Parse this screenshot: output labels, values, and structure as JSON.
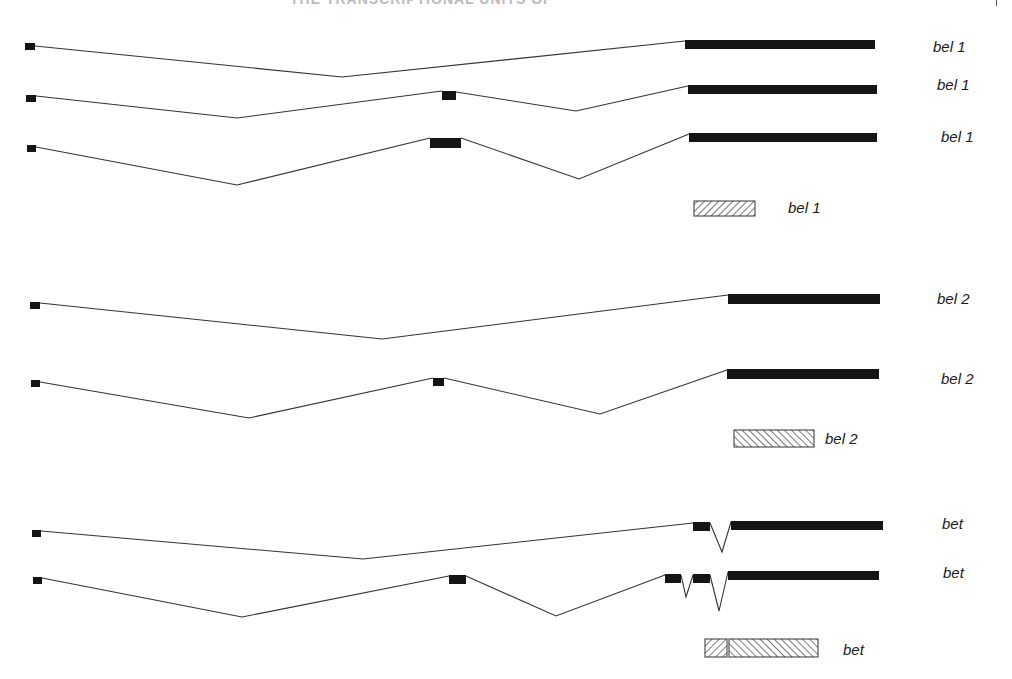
{
  "figure": {
    "header_text": "THE TRANSCRIPTIONAL UNITS OF",
    "colors": {
      "exon": "#151515",
      "intron_line": "#333333",
      "hatch": "#333333",
      "background": "#ffffff"
    },
    "groups": [
      {
        "name": "bel 1",
        "transcripts": [
          {
            "label": "bel 1",
            "label_pos": [
              933,
              38
            ],
            "exons": [
              [
                25,
                43,
                10,
                7
              ],
              [
                685,
                40,
                190,
                9
              ]
            ],
            "introns": [
              [
                [
                  35,
                  46
                ],
                [
                  342,
                  77
                ],
                [
                  685,
                  41
                ]
              ]
            ]
          },
          {
            "label": "bel 1",
            "label_pos": [
              937,
              76
            ],
            "exons": [
              [
                26,
                95,
                10,
                7
              ],
              [
                442,
                91,
                14,
                9
              ],
              [
                688,
                85,
                189,
                9
              ]
            ],
            "introns": [
              [
                [
                  36,
                  96
                ],
                [
                  237,
                  118
                ],
                [
                  442,
                  91
                ]
              ],
              [
                [
                  456,
                  92
                ],
                [
                  576,
                  111
                ],
                [
                  688,
                  86
                ]
              ]
            ]
          },
          {
            "label": "bel 1",
            "label_pos": [
              941,
              128
            ],
            "exons": [
              [
                27,
                145,
                9,
                7
              ],
              [
                430,
                138,
                31,
                10
              ],
              [
                689,
                133,
                188,
                9
              ]
            ],
            "introns": [
              [
                [
                  36,
                  147
                ],
                [
                  237,
                  185
                ],
                [
                  430,
                  138
                ]
              ],
              [
                [
                  461,
                  138
                ],
                [
                  579,
                  179
                ],
                [
                  689,
                  134
                ]
              ]
            ]
          }
        ],
        "protein": {
          "label": "bel 1",
          "label_pos": [
            788,
            199
          ],
          "boxes": [
            {
              "x": 694,
              "y": 201,
              "w": 61,
              "h": 15,
              "hatch": "forward"
            }
          ]
        }
      },
      {
        "name": "bel 2",
        "transcripts": [
          {
            "label": "bel 2",
            "label_pos": [
              937,
              290
            ],
            "exons": [
              [
                30,
                302,
                10,
                7
              ],
              [
                728,
                294,
                152,
                10
              ]
            ],
            "introns": [
              [
                [
                  40,
                  303
                ],
                [
                  382,
                  339
                ],
                [
                  728,
                  295
                ]
              ]
            ]
          },
          {
            "label": "bel 2",
            "label_pos": [
              941,
              370
            ],
            "exons": [
              [
                31,
                380,
                9,
                7
              ],
              [
                433,
                378,
                11,
                8
              ],
              [
                727,
                369,
                152,
                10
              ]
            ],
            "introns": [
              [
                [
                  40,
                  382
                ],
                [
                  249,
                  418
                ],
                [
                  433,
                  378
                ]
              ],
              [
                [
                  444,
                  378
                ],
                [
                  600,
                  414
                ],
                [
                  727,
                  370
                ]
              ]
            ]
          }
        ],
        "protein": {
          "label": "bel 2",
          "label_pos": [
            825,
            430
          ],
          "boxes": [
            {
              "x": 734,
              "y": 430,
              "w": 80,
              "h": 17,
              "hatch": "backward"
            }
          ]
        }
      },
      {
        "name": "bet",
        "transcripts": [
          {
            "label": "bet",
            "label_pos": [
              942,
              515
            ],
            "exons": [
              [
                32,
                530,
                9,
                7
              ],
              [
                693,
                522,
                17,
                9
              ],
              [
                731,
                521,
                152,
                9
              ]
            ],
            "introns": [
              [
                [
                  41,
                  531
                ],
                [
                  363,
                  559
                ],
                [
                  693,
                  523
                ]
              ],
              [
                [
                  710,
                  523
                ],
                [
                  722,
                  552
                ],
                [
                  731,
                  522
                ]
              ]
            ]
          },
          {
            "label": "bet",
            "label_pos": [
              943,
              564
            ],
            "exons": [
              [
                33,
                577,
                9,
                7
              ],
              [
                449,
                575,
                17,
                9
              ],
              [
                665,
                574,
                16,
                9
              ],
              [
                693,
                574,
                17,
                9
              ],
              [
                728,
                571,
                151,
                9
              ]
            ],
            "introns": [
              [
                [
                  42,
                  578
                ],
                [
                  242,
                  617
                ],
                [
                  449,
                  576
                ]
              ],
              [
                [
                  466,
                  576
                ],
                [
                  556,
                  616
                ],
                [
                  665,
                  575
                ]
              ],
              [
                [
                  681,
                  575
                ],
                [
                  686,
                  597
                ],
                [
                  693,
                  575
                ]
              ],
              [
                [
                  710,
                  575
                ],
                [
                  719,
                  611
                ],
                [
                  728,
                  572
                ]
              ]
            ]
          }
        ],
        "protein": {
          "label": "bet",
          "label_pos": [
            843,
            641
          ],
          "boxes": [
            {
              "x": 705,
              "y": 639,
              "w": 22,
              "h": 18,
              "hatch": "forward"
            },
            {
              "x": 729,
              "y": 639,
              "w": 89,
              "h": 18,
              "hatch": "backward"
            }
          ]
        }
      }
    ]
  }
}
